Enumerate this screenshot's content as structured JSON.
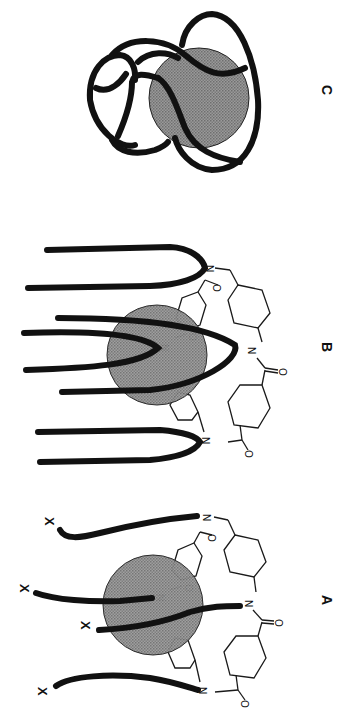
{
  "figure": {
    "orientation": "rotated 90 degrees clockwise",
    "sphere_color": "#8a8a8a",
    "chain_color": "#111111",
    "panels": [
      {
        "id": "A",
        "label": "A",
        "description": "Macrocycle with four X-terminated chains threaded through a sphere",
        "end_group_label": "X",
        "end_groups": [
          "X",
          "X",
          "X",
          "X"
        ],
        "atoms": [
          "N",
          "N",
          "N",
          "N",
          "O",
          "O",
          "O"
        ]
      },
      {
        "id": "B",
        "label": "B",
        "description": "Macrocycle with looped chains threaded through a sphere",
        "atoms": [
          "N",
          "N",
          "N",
          "N",
          "O",
          "O",
          "O"
        ]
      },
      {
        "id": "C",
        "label": "C",
        "description": "Knotted loops wrapped around a sphere"
      }
    ],
    "atom_labels": {
      "nitrogen": "N",
      "oxygen": "O"
    }
  }
}
